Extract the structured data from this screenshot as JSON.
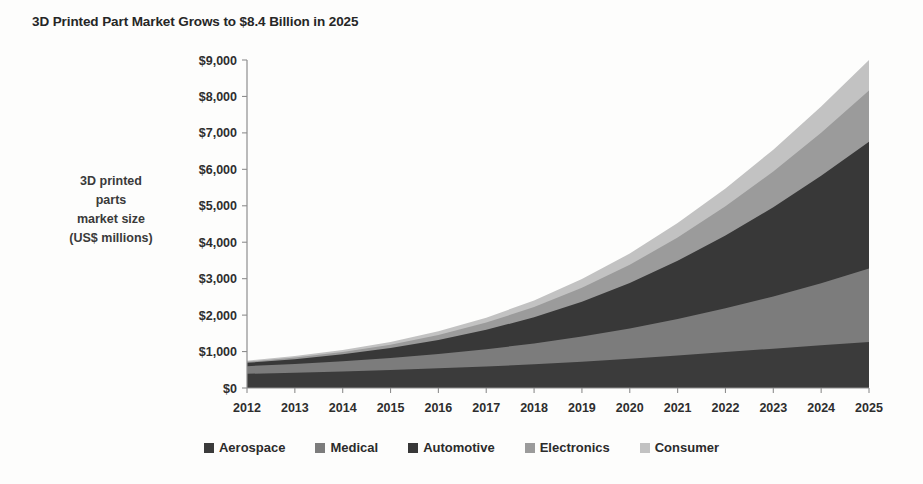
{
  "chart_data": {
    "type": "area",
    "title": "3D Printed Part Market Grows to $8.4 Billion in 2025",
    "xlabel": "",
    "ylabel": "3D printed parts market size (US$ millions)",
    "ylabel_lines": [
      "3D printed",
      "parts",
      "market size",
      "(US$ millions)"
    ],
    "stacked": true,
    "grid": false,
    "legend_position": "bottom",
    "ylim": [
      0,
      9000
    ],
    "ytick_step": 1000,
    "categories": [
      2012,
      2013,
      2014,
      2015,
      2016,
      2017,
      2018,
      2019,
      2020,
      2021,
      2022,
      2023,
      2024,
      2025
    ],
    "ytick_labels": [
      "$0",
      "$1,000",
      "$2,000",
      "$3,000",
      "$4,000",
      "$5,000",
      "$6,000",
      "$7,000",
      "$8,000",
      "$9,000"
    ],
    "xtick_labels": [
      "2012",
      "2013",
      "2014",
      "2015",
      "2016",
      "2017",
      "2018",
      "2019",
      "2020",
      "2021",
      "2022",
      "2023",
      "2024",
      "2025"
    ],
    "series": [
      {
        "name": "Aerospace",
        "color": "#3b3b3b",
        "values": [
          390,
          420,
          455,
          495,
          540,
          590,
          650,
          720,
          800,
          890,
          985,
          1080,
          1175,
          1260
        ]
      },
      {
        "name": "Medical",
        "color": "#7c7c7c",
        "values": [
          210,
          240,
          280,
          330,
          395,
          475,
          570,
          690,
          830,
          1000,
          1200,
          1430,
          1700,
          2020
        ]
      },
      {
        "name": "Automotive",
        "color": "#383838",
        "values": [
          90,
          130,
          190,
          270,
          380,
          530,
          720,
          960,
          1250,
          1600,
          2000,
          2450,
          2950,
          3480
        ]
      },
      {
        "name": "Electronics",
        "color": "#9b9b9b",
        "values": [
          30,
          45,
          65,
          95,
          140,
          200,
          280,
          380,
          500,
          640,
          800,
          980,
          1180,
          1400
        ]
      },
      {
        "name": "Consumer",
        "color": "#c2c2c2",
        "values": [
          30,
          40,
          55,
          75,
          100,
          135,
          180,
          240,
          310,
          395,
          490,
          600,
          720,
          840
        ]
      }
    ],
    "total_2025": 9000,
    "headline_value": "$8.4 Billion"
  },
  "legend": {
    "items": [
      {
        "label": "Aerospace",
        "color": "#3b3b3b"
      },
      {
        "label": "Medical",
        "color": "#7c7c7c"
      },
      {
        "label": "Automotive",
        "color": "#383838"
      },
      {
        "label": "Electronics",
        "color": "#9b9b9b"
      },
      {
        "label": "Consumer",
        "color": "#c2c2c2"
      }
    ]
  }
}
